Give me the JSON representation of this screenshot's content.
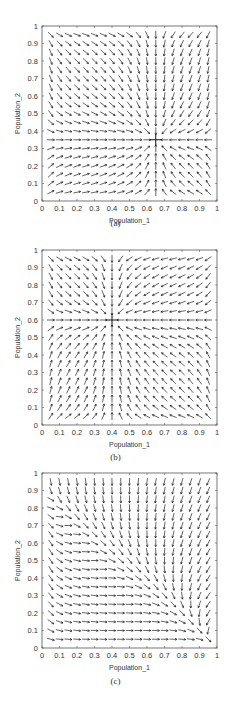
{
  "figure": {
    "panels": [
      {
        "caption": "(a)",
        "xlabel": "Population_1",
        "ylabel": "Population_2"
      },
      {
        "caption": "(b)",
        "xlabel": "Population_1",
        "ylabel": "Population_2"
      },
      {
        "caption": "(c)",
        "xlabel": "Population_1",
        "ylabel": "Population_2"
      }
    ]
  },
  "chart_data": [
    {
      "type": "quiver",
      "title": "",
      "caption": "(a)",
      "xlabel": "Population_1",
      "ylabel": "Population_2",
      "xlim": [
        0,
        1
      ],
      "ylim": [
        0,
        1
      ],
      "xticks": [
        "0",
        "0.1",
        "0.2",
        "0.3",
        "0.4",
        "0.5",
        "0.6",
        "0.7",
        "0.8",
        "0.9",
        "1"
      ],
      "yticks": [
        "0",
        "0.1",
        "0.2",
        "0.3",
        "0.4",
        "0.5",
        "0.6",
        "0.7",
        "0.8",
        "0.9",
        "1"
      ],
      "grid_points": {
        "start": 0.05,
        "stop": 0.95,
        "step": 0.05
      },
      "field": "converges to stable equilibrium",
      "equilibrium": [
        0.65,
        0.35
      ],
      "marker": "+"
    },
    {
      "type": "quiver",
      "title": "",
      "caption": "(b)",
      "xlabel": "Population_1",
      "ylabel": "Population_2",
      "xlim": [
        0,
        1
      ],
      "ylim": [
        0,
        1
      ],
      "xticks": [
        "0",
        "0.1",
        "0.2",
        "0.3",
        "0.4",
        "0.5",
        "0.6",
        "0.7",
        "0.8",
        "0.9",
        "1"
      ],
      "yticks": [
        "0",
        "0.1",
        "0.2",
        "0.3",
        "0.4",
        "0.5",
        "0.6",
        "0.7",
        "0.8",
        "0.9",
        "1"
      ],
      "grid_points": {
        "start": 0.05,
        "stop": 0.95,
        "step": 0.05
      },
      "field": "converges to stable equilibrium",
      "equilibrium": [
        0.4,
        0.6
      ],
      "marker": "+"
    },
    {
      "type": "quiver",
      "title": "",
      "caption": "(c)",
      "xlabel": "Population_1",
      "ylabel": "Population_2",
      "xlim": [
        0,
        1
      ],
      "ylim": [
        0,
        1
      ],
      "xticks": [
        "0",
        "0.1",
        "0.2",
        "0.3",
        "0.4",
        "0.5",
        "0.6",
        "0.7",
        "0.8",
        "0.9",
        "1"
      ],
      "yticks": [
        "0",
        "0.1",
        "0.2",
        "0.3",
        "0.4",
        "0.5",
        "0.6",
        "0.7",
        "0.8",
        "0.9",
        "1"
      ],
      "grid_points": {
        "start": 0.05,
        "stop": 0.95,
        "step": 0.05
      },
      "field": "flows to corner (competitive exclusion, population_1 wins)",
      "equilibrium": [
        1.0,
        0.0
      ],
      "marker": "none"
    }
  ],
  "layout": {
    "panel_tops": [
      26,
      250,
      473
    ],
    "plot_left": 42,
    "plot_width": 175,
    "plot_height": 175,
    "caption_offsets": 210
  }
}
